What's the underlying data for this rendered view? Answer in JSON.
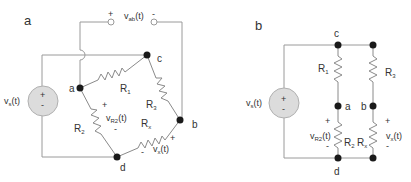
{
  "figure": {
    "panel_a": {
      "label": "a",
      "source": {
        "name": "vs(t)",
        "main": "v",
        "sub": "s",
        "suffix": "(t)",
        "plus": "+",
        "minus": "-"
      },
      "output_terminals": {
        "main": "v",
        "sub": "ab",
        "suffix": "(t)",
        "plus": "+",
        "minus": "-"
      },
      "nodes": {
        "a": "a",
        "b": "b",
        "c": "c",
        "d": "d"
      },
      "resistors": {
        "R1": {
          "main": "R",
          "sub": "1"
        },
        "R2": {
          "main": "R",
          "sub": "2"
        },
        "R3": {
          "main": "R",
          "sub": "3"
        },
        "Rx": {
          "main": "R",
          "sub": "x"
        }
      },
      "vR2": {
        "main": "v",
        "sub": "R2",
        "suffix": "(t)",
        "plus": "+",
        "minus": "-"
      },
      "vx": {
        "main": "v",
        "sub": "x",
        "suffix": "(t)",
        "plus": "+",
        "minus": "-"
      }
    },
    "panel_b": {
      "label": "b",
      "source": {
        "main": "v",
        "sub": "s",
        "suffix": "(t)",
        "plus": "+",
        "minus": "-"
      },
      "nodes": {
        "a": "a",
        "b": "b",
        "c": "c",
        "d": "d"
      },
      "resistors": {
        "R1": {
          "main": "R",
          "sub": "1"
        },
        "R2": {
          "main": "R",
          "sub": "2"
        },
        "R3": {
          "main": "R",
          "sub": "3"
        },
        "Rx": {
          "main": "R",
          "sub": "x"
        }
      },
      "vR2": {
        "main": "v",
        "sub": "R2",
        "suffix": "(t)",
        "plus": "+",
        "minus": "-"
      },
      "vx": {
        "main": "v",
        "sub": "x",
        "suffix": "(t)",
        "plus": "+",
        "minus": "-"
      }
    }
  }
}
